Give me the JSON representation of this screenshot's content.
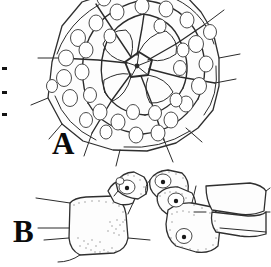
{
  "figure": {
    "background_color": "#ffffff",
    "ink_color": "#2b2b2b",
    "width": 271,
    "height": 267,
    "panels": [
      {
        "id": "A",
        "label": "A",
        "label_x": 52,
        "label_y": 128,
        "view": "apical / aboral view",
        "description": "Radially arranged polygonal plates with rounded tubercles surrounding a central pentagonal apical system",
        "cropped_at_top": true,
        "tubercle_count": 34,
        "ray_count": 5
      },
      {
        "id": "B",
        "label": "B",
        "label_x": 13,
        "label_y": 216,
        "view": "lateral view",
        "description": "Series of adjoining plates in side view bearing tubercles with dark central mamelons and stippled granular patches",
        "tubercle_count": 5,
        "plate_count": 6
      }
    ],
    "edge_marks": {
      "name": "left-margin-tick-marks",
      "count": 3,
      "color": "#141414",
      "positions": [
        {
          "x": 2,
          "y": 67,
          "w": 5,
          "h": 3
        },
        {
          "x": 2,
          "y": 91,
          "w": 5,
          "h": 3
        },
        {
          "x": 2,
          "y": 113,
          "w": 5,
          "h": 3
        }
      ]
    }
  }
}
